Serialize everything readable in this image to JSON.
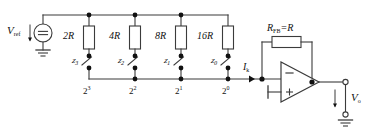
{
  "diagram": {
    "type": "schematic",
    "source": {
      "name": "reference-voltage-source",
      "label": "V",
      "label_sub": "ref",
      "symbol": "=",
      "symbol_meaning": "dc-voltage-source"
    },
    "resistors": [
      {
        "label": "2R",
        "bit": "z",
        "bit_sub": "3",
        "weight_base": "2",
        "weight_exp": "3"
      },
      {
        "label": "4R",
        "bit": "z",
        "bit_sub": "2",
        "weight_base": "2",
        "weight_exp": "2"
      },
      {
        "label": "8R",
        "bit": "z",
        "bit_sub": "1",
        "weight_base": "2",
        "weight_exp": "1"
      },
      {
        "label": "16R",
        "bit": "z",
        "bit_sub": "0",
        "weight_base": "2",
        "weight_exp": "0"
      }
    ],
    "current": {
      "label": "I",
      "label_sub": "k"
    },
    "feedback": {
      "label": "R",
      "label_sub": "FB",
      "equals": "=R",
      "full": "RFB=R"
    },
    "opamp": {
      "inverting_input": "−",
      "noninverting_input": "+",
      "noninverting_grounded": true
    },
    "output": {
      "label": "V",
      "label_sub": "o"
    },
    "colors": {
      "wire": "#3b3b3b",
      "node": "#111111",
      "text": "#111111",
      "background": "#ffffff",
      "component_fill": "#ffffff"
    }
  }
}
